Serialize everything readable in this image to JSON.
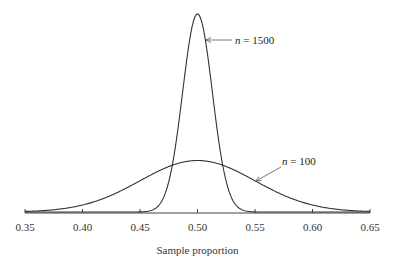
{
  "chart_data": {
    "type": "line",
    "title": "",
    "xlabel": "Sample proportion",
    "ylabel": "",
    "xlim": [
      0.35,
      0.65
    ],
    "x_ticks": [
      "0.35",
      "0.40",
      "0.45",
      "0.50",
      "0.55",
      "0.60",
      "0.65"
    ],
    "grid": false,
    "legend": "none (inline annotations)",
    "series": [
      {
        "name": "n = 1500",
        "distribution": "normal",
        "mean": 0.5,
        "sd": 0.0129,
        "relative_peak_height": 1.0
      },
      {
        "name": "n = 100",
        "distribution": "normal",
        "mean": 0.5,
        "sd": 0.05,
        "relative_peak_height": 0.26
      }
    ],
    "annotations": [
      {
        "text": "n = 1500",
        "points_to": "n = 1500 curve near peak"
      },
      {
        "text": "n = 100",
        "points_to": "n = 100 curve right flank"
      }
    ]
  },
  "labels": {
    "annot_n1500_var": "n",
    "annot_n1500_rest": " = 1500",
    "annot_n100_var": "n",
    "annot_n100_rest": " = 100",
    "xlabel": "Sample proportion",
    "ticks": [
      "0.35",
      "0.40",
      "0.45",
      "0.50",
      "0.55",
      "0.60",
      "0.65"
    ]
  }
}
